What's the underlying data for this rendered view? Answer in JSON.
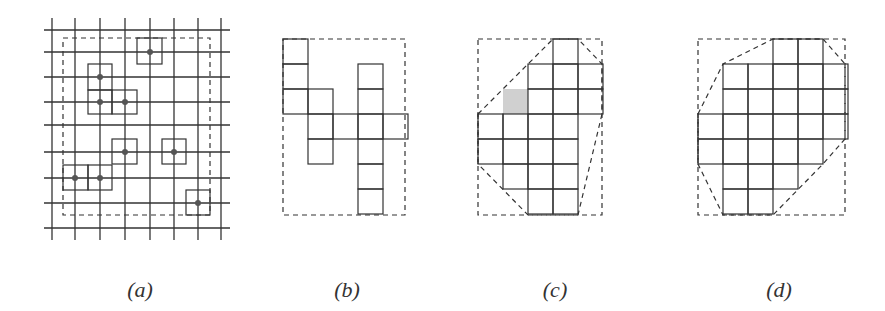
{
  "figure": {
    "stroke_color": "#333333",
    "gray_fill": "#d0d0d0",
    "cell_size": 25,
    "panels": [
      {
        "id": "a",
        "label": "(a)",
        "label_x": 140,
        "grid": {
          "x_lines": [
            52,
            75,
            100,
            125,
            150,
            174,
            198,
            221
          ],
          "y_lines": [
            30,
            52,
            77,
            102,
            125,
            152,
            178,
            203,
            228
          ],
          "x_extent": [
            44,
            230
          ],
          "y_extent": [
            18,
            240
          ]
        },
        "dashed_rect": [
          63,
          38,
          210,
          215
        ],
        "boxes": [
          [
            137,
            38,
            162,
            64
          ],
          [
            88,
            64,
            112,
            90
          ],
          [
            88,
            90,
            112,
            114
          ],
          [
            112,
            90,
            137,
            114
          ],
          [
            112,
            139,
            137,
            164
          ],
          [
            162,
            139,
            186,
            164
          ],
          [
            63,
            165,
            88,
            190
          ],
          [
            88,
            165,
            112,
            190
          ],
          [
            186,
            190,
            210,
            215
          ]
        ],
        "points": [
          [
            150,
            52
          ],
          [
            100,
            77
          ],
          [
            100,
            102
          ],
          [
            125,
            102
          ],
          [
            125,
            152
          ],
          [
            174,
            152
          ],
          [
            75,
            178
          ],
          [
            100,
            178
          ],
          [
            198,
            203
          ]
        ]
      },
      {
        "id": "b",
        "label": "(b)",
        "label_x": 347,
        "origin": [
          283,
          39
        ],
        "dashed_rect": [
          283,
          39,
          405,
          215
        ],
        "cells": [
          [
            0,
            0
          ],
          [
            0,
            1
          ],
          [
            0,
            2
          ],
          [
            1,
            2
          ],
          [
            1,
            3
          ],
          [
            1,
            4
          ],
          [
            2,
            3
          ],
          [
            3,
            1
          ],
          [
            3,
            2
          ],
          [
            3,
            3
          ],
          [
            3,
            4
          ],
          [
            3,
            5
          ],
          [
            3,
            6
          ],
          [
            4,
            3
          ]
        ]
      },
      {
        "id": "c",
        "label": "(c)",
        "label_x": 555,
        "origin": [
          478,
          39
        ],
        "dashed_rect": [
          478,
          39,
          602,
          215
        ],
        "cells": [
          [
            3,
            0
          ],
          [
            2,
            1
          ],
          [
            3,
            1
          ],
          [
            4,
            1
          ],
          [
            2,
            2
          ],
          [
            3,
            2
          ],
          [
            4,
            2
          ],
          [
            0,
            3
          ],
          [
            1,
            3
          ],
          [
            2,
            3
          ],
          [
            3,
            3
          ],
          [
            0,
            4
          ],
          [
            1,
            4
          ],
          [
            2,
            4
          ],
          [
            3,
            4
          ],
          [
            1,
            5
          ],
          [
            2,
            5
          ],
          [
            3,
            5
          ],
          [
            2,
            6
          ],
          [
            3,
            6
          ]
        ],
        "gray_cells": [
          [
            1,
            2
          ]
        ],
        "hull": [
          [
            478,
            114
          ],
          [
            528,
            64
          ],
          [
            553,
            39
          ],
          [
            578,
            39
          ],
          [
            602,
            64
          ],
          [
            602,
            114
          ],
          [
            578,
            215
          ],
          [
            528,
            215
          ],
          [
            478,
            164
          ]
        ]
      },
      {
        "id": "d",
        "label": "(d)",
        "label_x": 779,
        "origin": [
          698,
          39
        ],
        "dashed_rect": [
          698,
          39,
          845,
          215
        ],
        "cells": [
          [
            3,
            0
          ],
          [
            4,
            0
          ],
          [
            1,
            1
          ],
          [
            2,
            1
          ],
          [
            3,
            1
          ],
          [
            4,
            1
          ],
          [
            5,
            1
          ],
          [
            1,
            2
          ],
          [
            2,
            2
          ],
          [
            3,
            2
          ],
          [
            4,
            2
          ],
          [
            5,
            2
          ],
          [
            0,
            3
          ],
          [
            1,
            3
          ],
          [
            2,
            3
          ],
          [
            3,
            3
          ],
          [
            4,
            3
          ],
          [
            5,
            3
          ],
          [
            0,
            4
          ],
          [
            1,
            4
          ],
          [
            2,
            4
          ],
          [
            3,
            4
          ],
          [
            4,
            4
          ],
          [
            1,
            5
          ],
          [
            2,
            5
          ],
          [
            3,
            5
          ],
          [
            1,
            6
          ],
          [
            2,
            6
          ]
        ],
        "hull": [
          [
            698,
            114
          ],
          [
            723,
            64
          ],
          [
            773,
            39
          ],
          [
            823,
            39
          ],
          [
            845,
            64
          ],
          [
            845,
            139
          ],
          [
            823,
            164
          ],
          [
            773,
            215
          ],
          [
            723,
            215
          ],
          [
            698,
            164
          ]
        ]
      }
    ]
  }
}
